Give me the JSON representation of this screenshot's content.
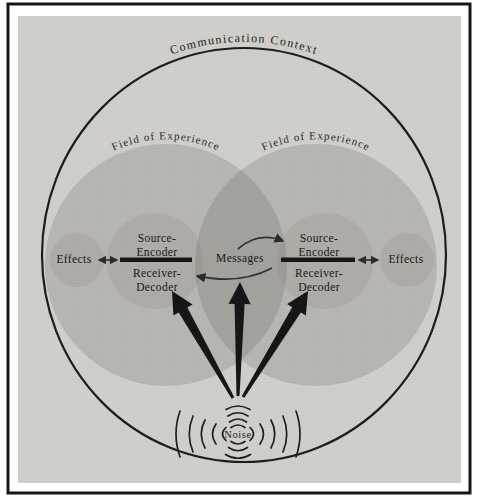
{
  "diagram": {
    "title": "Communication Context",
    "field_label_left": "Field of Experience",
    "field_label_right": "Field of Experience",
    "left_participant": {
      "source_line1": "Source-",
      "source_line2": "Encoder",
      "receiver_line1": "Receiver-",
      "receiver_line2": "Decoder",
      "effects": "Effects"
    },
    "right_participant": {
      "source_line1": "Source-",
      "source_line2": "Encoder",
      "receiver_line1": "Receiver-",
      "receiver_line2": "Decoder",
      "effects": "Effects"
    },
    "messages": "Messages",
    "noise": "Noise"
  },
  "colors": {
    "panel": "#d1cfc9",
    "shade": "#55534e",
    "ink": "#161616",
    "line": "#1d1d1d"
  }
}
